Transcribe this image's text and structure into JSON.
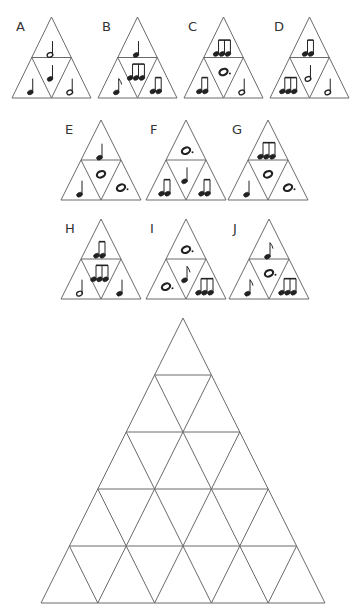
{
  "colors": {
    "line": "#6a6a6a",
    "ink": "#222222",
    "label": "#333333",
    "background": "#ffffff"
  },
  "note_types": {
    "quarter": "quarter-note",
    "half": "half-note",
    "eighth": "eighth-note",
    "two_eighths": "two-beamed-eighth-notes",
    "triplet": "three-beamed-eighth-notes",
    "whole": "whole-note",
    "dotted_whole": "dotted-whole-note"
  },
  "pieces": [
    {
      "label": "A",
      "x": 12,
      "y": 17,
      "w": 79,
      "h": 81,
      "cells": {
        "top": "half",
        "left": "quarter",
        "center": "quarter",
        "right": "half"
      }
    },
    {
      "label": "B",
      "x": 98,
      "y": 17,
      "w": 79,
      "h": 81,
      "cells": {
        "top": "quarter",
        "left": "eighth",
        "center": "triplet",
        "right": "two_eighths"
      }
    },
    {
      "label": "C",
      "x": 184,
      "y": 17,
      "w": 79,
      "h": 81,
      "cells": {
        "top": "triplet",
        "left": "two_eighths",
        "center": "dotted_whole",
        "right": "half"
      }
    },
    {
      "label": "D",
      "x": 270,
      "y": 17,
      "w": 79,
      "h": 81,
      "cells": {
        "top": "two_eighths",
        "left": "triplet",
        "center": "half",
        "right": "half"
      }
    },
    {
      "label": "E",
      "x": 61,
      "y": 120,
      "w": 80,
      "h": 80,
      "cells": {
        "top": "quarter",
        "left": "quarter",
        "center": "whole",
        "right": "dotted_whole"
      }
    },
    {
      "label": "F",
      "x": 146,
      "y": 120,
      "w": 80,
      "h": 80,
      "cells": {
        "top": "dotted_whole",
        "left": "two_eighths",
        "center": "quarter",
        "right": "two_eighths"
      }
    },
    {
      "label": "G",
      "x": 228,
      "y": 120,
      "w": 80,
      "h": 80,
      "cells": {
        "top": "triplet",
        "left": "quarter",
        "center": "whole",
        "right": "dotted_whole"
      }
    },
    {
      "label": "H",
      "x": 61,
      "y": 219,
      "w": 80,
      "h": 80,
      "cells": {
        "top": "two_eighths",
        "left": "half",
        "center": "triplet",
        "right": "quarter"
      }
    },
    {
      "label": "I",
      "x": 146,
      "y": 219,
      "w": 80,
      "h": 80,
      "cells": {
        "top": "dotted_whole",
        "left": "dotted_whole",
        "center": "eighth",
        "right": "triplet"
      }
    },
    {
      "label": "J",
      "x": 229,
      "y": 219,
      "w": 80,
      "h": 80,
      "cells": {
        "top": "eighth",
        "left": "eighth",
        "center": "dotted_whole",
        "right": "triplet"
      }
    }
  ],
  "board": {
    "rows": 5,
    "apex_x": 183,
    "apex_y": 318,
    "base_y": 603,
    "base_left_x": 41,
    "base_right_x": 325,
    "cell_count": 25,
    "state": "empty"
  }
}
